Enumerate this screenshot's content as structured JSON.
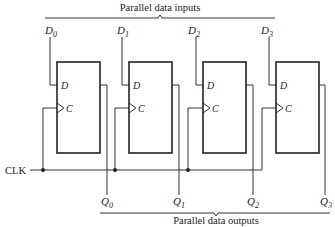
{
  "diagram": {
    "type": "parallel-in parallel-out shift register",
    "inputs_label": "Parallel data inputs",
    "outputs_label": "Parallel data outputs",
    "clock_label": "CLK",
    "flip_flops": [
      {
        "d_input": "D",
        "clock_input": "C",
        "data_in": {
          "base": "D",
          "sub": "0"
        },
        "data_out": {
          "base": "Q",
          "sub": "0"
        }
      },
      {
        "d_input": "D",
        "clock_input": "C",
        "data_in": {
          "base": "D",
          "sub": "1"
        },
        "data_out": {
          "base": "Q",
          "sub": "1"
        }
      },
      {
        "d_input": "D",
        "clock_input": "C",
        "data_in": {
          "base": "D",
          "sub": "2"
        },
        "data_out": {
          "base": "Q",
          "sub": "2"
        }
      },
      {
        "d_input": "D",
        "clock_input": "C",
        "data_in": {
          "base": "D",
          "sub": "3"
        },
        "data_out": {
          "base": "Q",
          "sub": "3"
        }
      }
    ],
    "colors": {
      "line": "#333333",
      "background": "#ffffff"
    }
  }
}
